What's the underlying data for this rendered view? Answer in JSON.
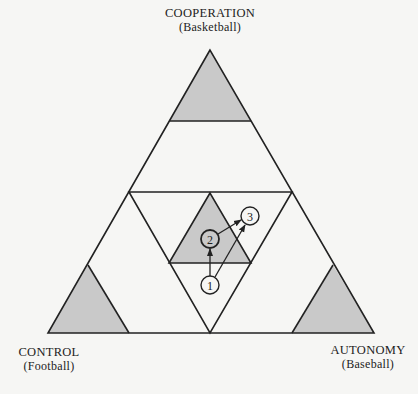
{
  "diagram": {
    "colors": {
      "background": "#f6f6f4",
      "line": "#222222",
      "shade": "#c9c9c9"
    },
    "vertices": {
      "top": {
        "label": "COOPERATION",
        "sublabel": "(Basketball)"
      },
      "bottom_left": {
        "label": "CONTROL",
        "sublabel": "(Football)"
      },
      "bottom_right": {
        "label": "AUTONOMY",
        "sublabel": "(Baseball)"
      }
    },
    "nodes": [
      {
        "id": "1",
        "label": "1",
        "cx": 210,
        "cy": 285
      },
      {
        "id": "2",
        "label": "2",
        "cx": 210,
        "cy": 239
      },
      {
        "id": "3",
        "label": "3",
        "cx": 250,
        "cy": 216
      }
    ],
    "arrows": [
      {
        "from": "1",
        "to": "2"
      },
      {
        "from": "2",
        "to": "3"
      },
      {
        "from": "1",
        "to": "3"
      }
    ],
    "shaded_regions": [
      "top-corner",
      "bottom-left-corner",
      "bottom-right-corner",
      "center"
    ]
  }
}
